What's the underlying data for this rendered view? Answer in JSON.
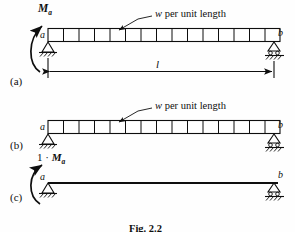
{
  "figure": {
    "caption": "Fig. 2.2",
    "panels": [
      {
        "tag": "(a)",
        "left_node": "a",
        "right_node": "b",
        "moment_label": "M",
        "moment_subscript": "a",
        "load_label": "w per unit length",
        "load_symbol": "w",
        "span_label": "l",
        "has_moment": true,
        "has_distributed_load": true,
        "has_span_dimension": true,
        "left_support": "pin-support",
        "right_support": "roller-support"
      },
      {
        "tag": "(b)",
        "left_node": "a",
        "right_node": "b",
        "load_label": "w per unit length",
        "load_symbol": "w",
        "has_moment": false,
        "has_distributed_load": true,
        "has_span_dimension": false,
        "left_support": "pin-support",
        "right_support": "roller-support"
      },
      {
        "tag": "(c)",
        "left_node": "a",
        "right_node": "b",
        "moment_label": "1 · M",
        "moment_subscript": "a",
        "unit_factor": "1",
        "has_moment": true,
        "has_distributed_load": false,
        "has_span_dimension": false,
        "left_support": "pin-support",
        "right_support": "roller-support"
      }
    ],
    "load_cell_count": 15,
    "colors": {
      "ink": "#0e0e0e",
      "background": "#fefefe"
    }
  }
}
